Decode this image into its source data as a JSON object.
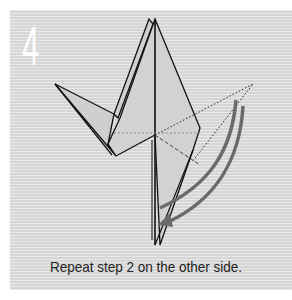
{
  "step": {
    "number": "4",
    "instruction": "Repeat step 2 on the other side."
  },
  "colors": {
    "panel_bg": "#dcdcdc",
    "paper_fill": "#cfcfcf",
    "outline": "#111111",
    "arrow": "#6a6a6a",
    "step_number": "#ffffff"
  },
  "diagram": {
    "icons": [
      "fold-arrow-icon",
      "fold-guide-dotted-line",
      "crease-dashed-line"
    ]
  }
}
